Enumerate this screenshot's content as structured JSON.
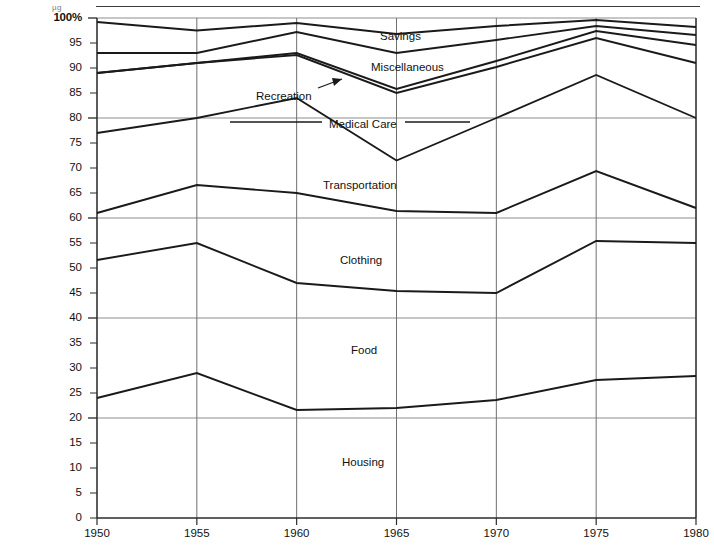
{
  "figure": {
    "top_rule_note": "µg",
    "y_axis": {
      "label_top": "100%",
      "ticks": [
        100,
        95,
        90,
        85,
        80,
        75,
        70,
        65,
        60,
        55,
        50,
        45,
        40,
        35,
        30,
        25,
        20,
        15,
        10,
        5,
        0
      ],
      "tick_labels": [
        "100%",
        "95",
        "90",
        "85",
        "80",
        "75",
        "70",
        "65",
        "60",
        "55",
        "50",
        "45",
        "40",
        "35",
        "30",
        "25",
        "20",
        "15",
        "10",
        "5",
        "0"
      ],
      "major_gridlines": [
        100,
        80,
        60,
        40,
        20
      ]
    },
    "x_axis": {
      "ticks": [
        1950,
        1955,
        1960,
        1965,
        1970,
        1975,
        1980
      ],
      "tick_labels": [
        "1950",
        "1955",
        "1960",
        "1965",
        "1970",
        "1975",
        "1980"
      ]
    },
    "series_labels": [
      {
        "key": "savings",
        "text": "Savings",
        "x": 380,
        "y": 30
      },
      {
        "key": "miscellaneous",
        "text": "Miscellaneous",
        "x": 371,
        "y": 61
      },
      {
        "key": "recreation",
        "text": "Recreation",
        "x": 256,
        "y": 90
      },
      {
        "key": "medical_care",
        "text": "Medical Care",
        "x": 329,
        "y": 118
      },
      {
        "key": "transportation",
        "text": "Transportation",
        "x": 323,
        "y": 179
      },
      {
        "key": "clothing",
        "text": "Clothing",
        "x": 340,
        "y": 254
      },
      {
        "key": "food",
        "text": "Food",
        "x": 351,
        "y": 344
      },
      {
        "key": "housing",
        "text": "Housing",
        "x": 342,
        "y": 456
      }
    ],
    "leader_lines": [
      {
        "name": "recreation-arrow",
        "x1": 318,
        "y1": 88,
        "x2": 342,
        "y2": 79
      },
      {
        "name": "medical-care-rule-left",
        "x1": 230,
        "y1": 122,
        "x2": 322,
        "y2": 122
      },
      {
        "name": "medical-care-rule-right",
        "x1": 405,
        "y1": 122,
        "x2": 470,
        "y2": 122
      }
    ]
  },
  "chart_data": {
    "type": "line",
    "title": "",
    "xlabel": "",
    "ylabel": "",
    "x": [
      1950,
      1955,
      1960,
      1965,
      1970,
      1975,
      1980
    ],
    "xlim": [
      1950,
      1980
    ],
    "ylim": [
      0,
      100
    ],
    "grid": true,
    "legend_position": "inline-labels",
    "note": "Cumulative percentage lines; bands between successive lines are the named categories.",
    "series": [
      {
        "name": "Savings",
        "values": [
          99.2,
          97.5,
          99.0,
          96.8,
          98.4,
          99.6,
          98.2
        ]
      },
      {
        "name": "Miscellaneous",
        "values": [
          93.0,
          93.0,
          97.2,
          93.0,
          95.6,
          98.4,
          96.6
        ]
      },
      {
        "name": "Recreation",
        "values": [
          89.0,
          91.0,
          93.0,
          85.8,
          91.4,
          97.4,
          94.6
        ]
      },
      {
        "name": "Medical Care",
        "values": [
          89.0,
          91.0,
          92.6,
          85.0,
          90.2,
          96.0,
          91.0
        ]
      },
      {
        "name": "Transportation",
        "values": [
          77.0,
          80.0,
          84.0,
          71.5,
          80.0,
          88.6,
          80.0
        ]
      },
      {
        "name": "Clothing",
        "values": [
          61.0,
          66.6,
          65.0,
          61.4,
          61.0,
          69.4,
          62.0
        ]
      },
      {
        "name": "Food",
        "values": [
          51.6,
          55.0,
          47.0,
          45.4,
          45.0,
          55.4,
          55.0
        ]
      },
      {
        "name": "Housing",
        "values": [
          24.0,
          29.0,
          21.6,
          22.0,
          23.6,
          27.6,
          28.4
        ]
      }
    ]
  }
}
